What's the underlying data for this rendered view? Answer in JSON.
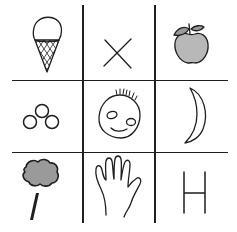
{
  "figure": {
    "type": "3x3 picture grid",
    "background": "#ffffff",
    "line_color": "#1e1e1e",
    "shade_color": "#b8b8b8",
    "grid": {
      "vertical_lines_x": [
        83,
        155
      ],
      "horizontal_lines_y": [
        80,
        152
      ],
      "h_extent": [
        12,
        228
      ],
      "v_extent": [
        5,
        223
      ]
    },
    "cells": [
      {
        "row": 1,
        "col": 1,
        "content": "ice cream cone"
      },
      {
        "row": 1,
        "col": 2,
        "content": "X mark"
      },
      {
        "row": 1,
        "col": 3,
        "content": "apple"
      },
      {
        "row": 2,
        "col": 1,
        "content": "three circles"
      },
      {
        "row": 2,
        "col": 2,
        "content": "smiling face"
      },
      {
        "row": 2,
        "col": 3,
        "content": "crescent moon"
      },
      {
        "row": 3,
        "col": 1,
        "content": "tree"
      },
      {
        "row": 3,
        "col": 2,
        "content": "hand"
      },
      {
        "row": 3,
        "col": 3,
        "content": "H",
        "letter": "H"
      }
    ]
  }
}
